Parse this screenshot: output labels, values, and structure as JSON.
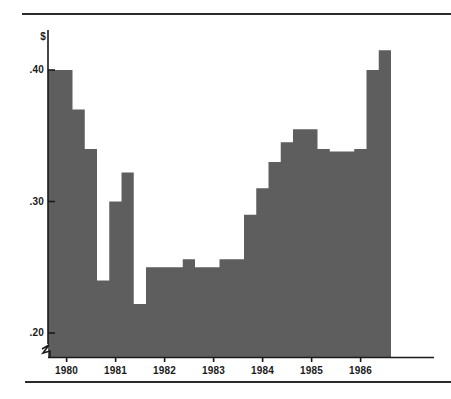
{
  "figure": {
    "top_rule": "horizontal-rule",
    "bottom_rule": "horizontal-rule"
  },
  "chart_data": {
    "type": "area",
    "subtype": "step-area",
    "title": "",
    "xlabel": "",
    "ylabel": "$",
    "y_unit_label": "$",
    "ylim": [
      0.2,
      0.425
    ],
    "y_axis_break": true,
    "y_ticks": [
      0.2,
      0.3,
      0.4
    ],
    "y_tick_labels": [
      ".20",
      ".30",
      ".40"
    ],
    "x_ticks": [
      1980,
      1981,
      1982,
      1983,
      1984,
      1985,
      1986
    ],
    "x_tick_labels": [
      "1980",
      "1981",
      "1982",
      "1983",
      "1984",
      "1985",
      "1986"
    ],
    "xlim": [
      1979.62,
      1986.62
    ],
    "grid": false,
    "legend": null,
    "fill_color": "#5e5e5e",
    "axis_color": "#1a1a1a",
    "background": "#ffffff",
    "x": [
      1979.62,
      1979.87,
      1980.12,
      1980.37,
      1980.62,
      1980.87,
      1981.12,
      1981.37,
      1981.62,
      1981.87,
      1982.12,
      1982.37,
      1982.62,
      1982.87,
      1983.12,
      1983.37,
      1983.62,
      1983.87,
      1984.12,
      1984.37,
      1984.62,
      1984.87,
      1985.12,
      1985.37,
      1985.62,
      1985.87,
      1986.12,
      1986.37
    ],
    "values": [
      0.4,
      0.4,
      0.37,
      0.34,
      0.24,
      0.3,
      0.322,
      0.222,
      0.25,
      0.25,
      0.25,
      0.256,
      0.25,
      0.25,
      0.256,
      0.256,
      0.29,
      0.31,
      0.33,
      0.345,
      0.355,
      0.355,
      0.34,
      0.338,
      0.338,
      0.34,
      0.4,
      0.415
    ]
  }
}
